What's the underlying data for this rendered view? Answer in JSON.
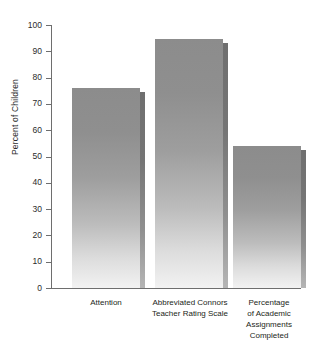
{
  "chart_data": {
    "type": "bar",
    "title": "",
    "subtitle": "",
    "xlabel": "",
    "ylabel": "Percent of Children",
    "ylim": [
      0,
      100
    ],
    "yticks": [
      0,
      10,
      20,
      30,
      40,
      50,
      60,
      70,
      80,
      90,
      100
    ],
    "ytick_labels": [
      "0",
      "10",
      "20",
      "30",
      "40",
      "50",
      "60",
      "70",
      "80",
      "90",
      "100"
    ],
    "grid": false,
    "legend": null,
    "orientation": "vertical",
    "categories": [
      "Attention",
      "Abbreviated Connors\nTeacher Rating Scale",
      "Percentage\nof Academic\nAssignments\nCompleted"
    ],
    "category_lines": [
      [
        "Attention"
      ],
      [
        "Abbreviated Connors",
        "Teacher Rating Scale"
      ],
      [
        "Percentage",
        "of Academic",
        "Assignments",
        "Completed"
      ]
    ],
    "values": [
      76,
      94.5,
      54
    ],
    "bar_color_top": "#8c8c8c",
    "bar_color_bottom": "#f2f2f2",
    "axis_color": "#6e6e6e"
  },
  "axis": {
    "y_title": "Percent of Children"
  }
}
